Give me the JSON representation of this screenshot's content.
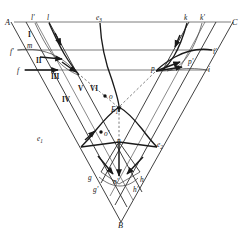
{
  "figure": {
    "type": "geometric-diagram"
  },
  "vertices": [
    {
      "name": "A",
      "label": "A",
      "x": 11,
      "y": 22
    },
    {
      "name": "B",
      "label": "B",
      "x": 121,
      "y": 222
    },
    {
      "name": "C",
      "label": "C",
      "x": 233,
      "y": 22
    }
  ],
  "labels": {
    "top_left": [
      {
        "id": "l-prime",
        "text": "l",
        "prime": "'",
        "x": 34,
        "y": 20
      },
      {
        "id": "l",
        "text": "l",
        "prime": "",
        "x": 49,
        "y": 20
      }
    ],
    "top_center": [
      {
        "id": "e3",
        "text": "e",
        "sub": "3",
        "x": 99,
        "y": 20
      }
    ],
    "top_right": [
      {
        "id": "k",
        "text": "k",
        "prime": "",
        "x": 186,
        "y": 20
      },
      {
        "id": "k-prime",
        "text": "k",
        "prime": "'",
        "x": 203,
        "y": 20
      }
    ],
    "left_side": [
      {
        "id": "f-prime",
        "text": "f",
        "prime": "'",
        "x": 13,
        "y": 52
      },
      {
        "id": "m",
        "text": "m",
        "prime": "",
        "x": 31,
        "y": 47
      },
      {
        "id": "f",
        "text": "f",
        "prime": "",
        "x": 19,
        "y": 72
      },
      {
        "id": "e1",
        "text": "e",
        "sub": "1",
        "x": 40,
        "y": 139
      }
    ],
    "right_side": [
      {
        "id": "i-prime",
        "text": "i",
        "prime": "'",
        "x": 214,
        "y": 53
      },
      {
        "id": "p-prime",
        "text": "p",
        "prime": "'",
        "x": 190,
        "y": 62
      },
      {
        "id": "i",
        "text": "i",
        "prime": "",
        "x": 208,
        "y": 70
      },
      {
        "id": "p",
        "text": "p",
        "prime": "",
        "x": 154,
        "y": 70
      },
      {
        "id": "e2",
        "text": "e",
        "sub": "2",
        "x": 159,
        "y": 145
      }
    ],
    "regions": [
      {
        "id": "region-I",
        "text": "I",
        "x": 30,
        "y": 36
      },
      {
        "id": "region-II",
        "text": "II",
        "x": 39,
        "y": 62
      },
      {
        "id": "region-III",
        "text": "III",
        "x": 54,
        "y": 78
      },
      {
        "id": "region-IV",
        "text": "IV",
        "x": 66,
        "y": 101
      },
      {
        "id": "region-V",
        "text": "V",
        "x": 80,
        "y": 90
      },
      {
        "id": "region-VI",
        "text": "VI",
        "x": 93,
        "y": 90
      }
    ],
    "interior": [
      {
        "id": "o",
        "text": "o",
        "prime": "",
        "x": 111,
        "y": 98
      },
      {
        "id": "o-prime",
        "text": "o",
        "prime": "'",
        "x": 107,
        "y": 135
      },
      {
        "id": "E1",
        "text": "E",
        "sub": "1",
        "x": 114,
        "y": 109
      },
      {
        "id": "n",
        "text": "n",
        "prime": "",
        "x": 119,
        "y": 142
      }
    ],
    "bottom": [
      {
        "id": "g",
        "text": "g",
        "prime": "",
        "x": 91,
        "y": 178
      },
      {
        "id": "g-prime",
        "text": "g",
        "prime": "'",
        "x": 96,
        "y": 190
      },
      {
        "id": "n-prime",
        "text": "n",
        "prime": "'",
        "x": 116,
        "y": 182
      },
      {
        "id": "h",
        "text": "h",
        "prime": "",
        "x": 141,
        "y": 180
      },
      {
        "id": "h-prime",
        "text": "h",
        "prime": "'",
        "x": 135,
        "y": 190
      }
    ]
  },
  "dots": [
    {
      "id": "dot-o",
      "x": 105,
      "y": 96
    },
    {
      "id": "dot-o-prime",
      "x": 101,
      "y": 132
    }
  ],
  "colors": {
    "line": "#2b2b2b",
    "thin_line": "#4a4a4a",
    "bold_line": "#1a1a1a",
    "dashed": "#5a5a5a",
    "background": "#ffffff",
    "text": "#151515"
  }
}
